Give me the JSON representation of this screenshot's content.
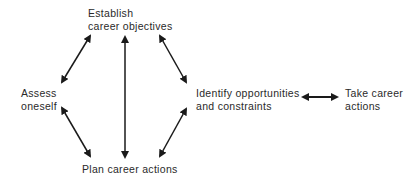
{
  "diagram": {
    "nodes": {
      "establish": {
        "line1": "Establish",
        "line2": "career objectives"
      },
      "assess": {
        "line1": "Assess",
        "line2": "oneself"
      },
      "identify": {
        "line1": "Identify opportunities",
        "line2": "and constraints"
      },
      "take": {
        "line1": "Take career",
        "line2": "actions"
      },
      "plan": {
        "line1": "Plan career actions"
      }
    },
    "edges": [
      {
        "from": "assess",
        "to": "establish",
        "direction": "both"
      },
      {
        "from": "establish",
        "to": "identify",
        "direction": "both"
      },
      {
        "from": "assess",
        "to": "plan",
        "direction": "both"
      },
      {
        "from": "identify",
        "to": "plan",
        "direction": "both"
      },
      {
        "from": "establish",
        "to": "plan",
        "direction": "both"
      },
      {
        "from": "identify",
        "to": "take",
        "direction": "both"
      }
    ],
    "colors": {
      "arrow": "#1a1a1a",
      "text": "#2a2a2a",
      "background": "#ffffff"
    }
  }
}
